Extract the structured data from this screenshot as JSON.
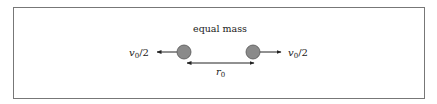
{
  "diagram": {
    "title": "equal mass",
    "left_velocity": {
      "symbol": "v",
      "subscript": "0",
      "suffix": "/2"
    },
    "right_velocity": {
      "symbol": "v",
      "subscript": "0",
      "suffix": "/2"
    },
    "separation": {
      "symbol": "r",
      "subscript": "0"
    },
    "colors": {
      "frame": "#777777",
      "mass_fill": "#8a8a8a",
      "mass_stroke": "#555555",
      "arrow": "#222222",
      "text": "#222222"
    },
    "masses": [
      {
        "name": "left-mass",
        "cx": 184,
        "cy": 52,
        "r": 7
      },
      {
        "name": "right-mass",
        "cx": 253,
        "cy": 52,
        "r": 7
      }
    ]
  }
}
